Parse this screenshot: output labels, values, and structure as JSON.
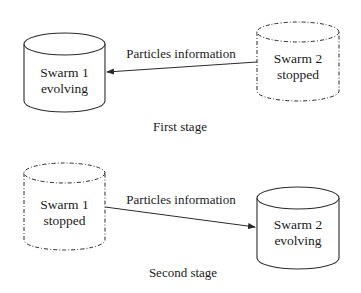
{
  "diagram": {
    "stages": [
      {
        "caption": "First stage",
        "nodes": [
          {
            "id": "swarm1",
            "line1": "Swarm 1",
            "line2": "evolving",
            "state": "evolving",
            "style": "solid"
          },
          {
            "id": "swarm2",
            "line1": "Swarm 2",
            "line2": "stopped",
            "state": "stopped",
            "style": "dash-dot"
          }
        ],
        "edge": {
          "from": "swarm2",
          "to": "swarm1",
          "label": "Particles information"
        }
      },
      {
        "caption": "Second stage",
        "nodes": [
          {
            "id": "swarm1",
            "line1": "Swarm 1",
            "line2": "stopped",
            "state": "stopped",
            "style": "dash-dot"
          },
          {
            "id": "swarm2",
            "line1": "Swarm 2",
            "line2": "evolving",
            "state": "evolving",
            "style": "solid"
          }
        ],
        "edge": {
          "from": "swarm1",
          "to": "swarm2",
          "label": "Particles information"
        }
      }
    ],
    "colors": {
      "stroke": "#2a2a2a",
      "background": "#ffffff"
    }
  }
}
